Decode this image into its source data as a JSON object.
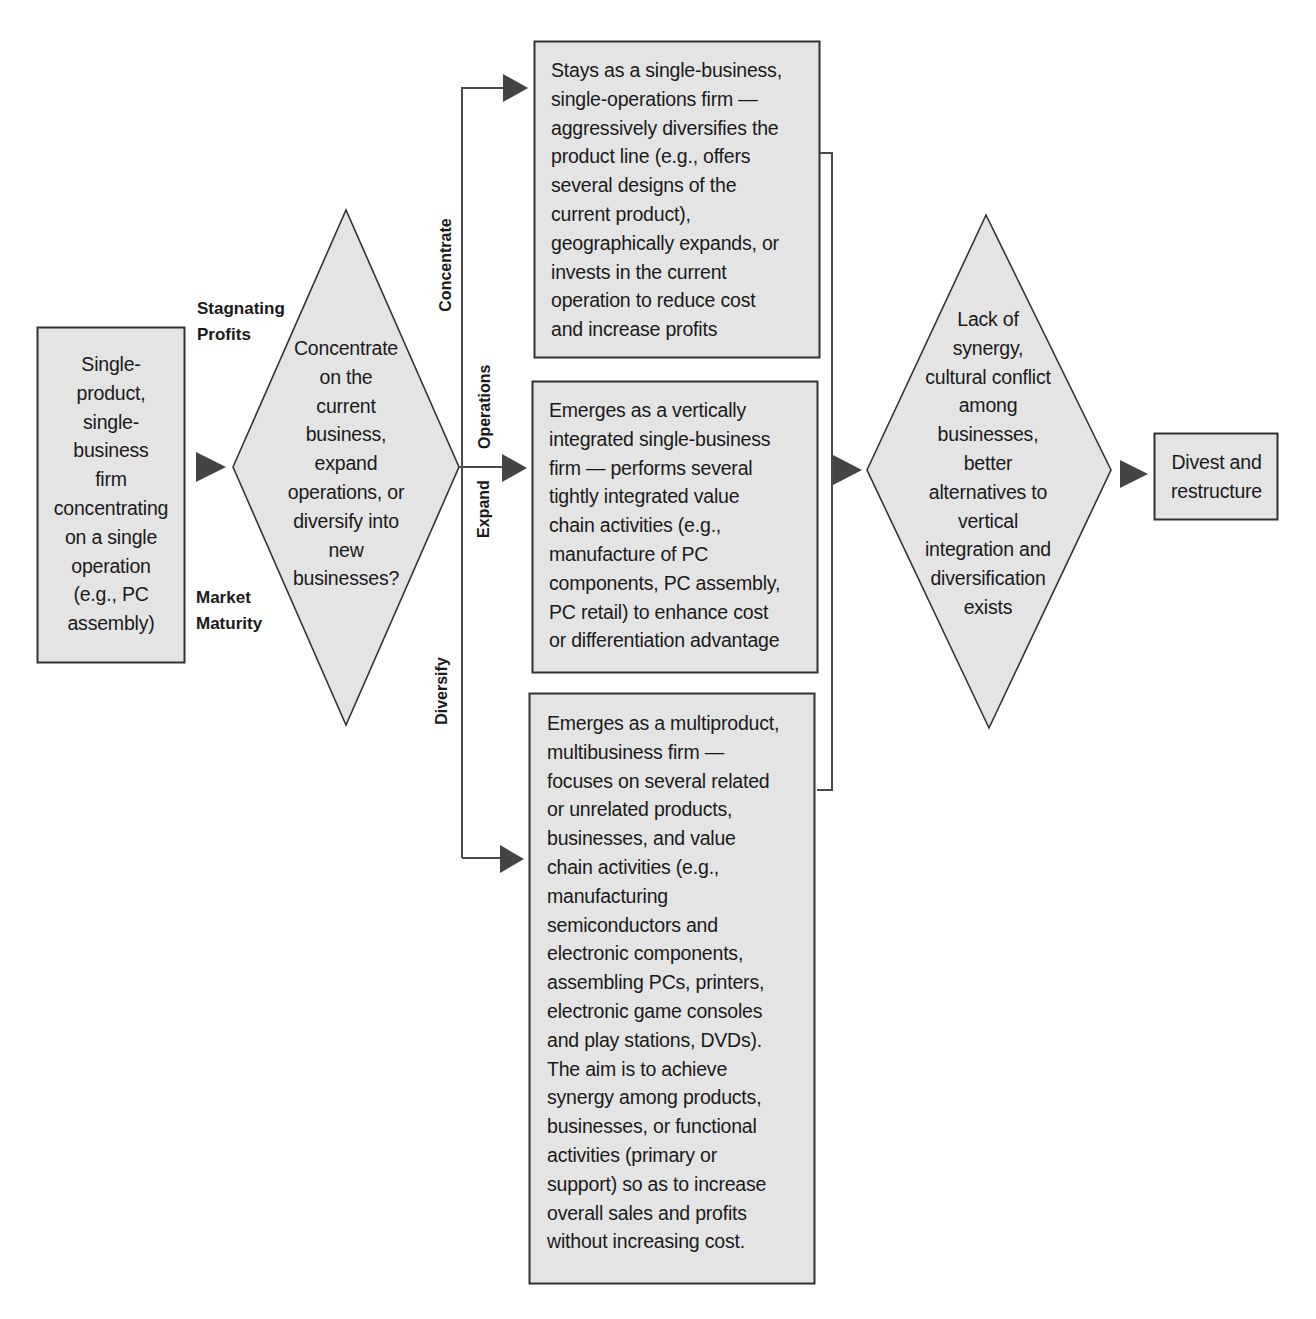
{
  "diagram": {
    "start_box": {
      "text": "Single-product, single-business firm concentrating on a single operation (e.g., PC assembly)",
      "lines": [
        "Single-",
        "product,",
        "single-",
        "business",
        "firm",
        "concentrating",
        "on a single",
        "operation",
        "(e.g., PC",
        "assembly)"
      ]
    },
    "triggers": {
      "top": [
        "Stagnating",
        "Profits"
      ],
      "bottom": [
        "Market",
        "Maturity"
      ]
    },
    "decision_1": {
      "lines": [
        "Concentrate",
        "on the",
        "current",
        "business,",
        "expand",
        "operations, or",
        "diversify into",
        "new",
        "businesses?"
      ]
    },
    "branch_labels": {
      "concentrate": "Concentrate",
      "expand": "Expand",
      "operations": "Operations",
      "diversify": "Diversify"
    },
    "outcomes": [
      {
        "id": "concentrate",
        "lines": [
          "Stays as a single-business,",
          "single-operations firm —",
          "aggressively diversifies the",
          "product line (e.g., offers",
          "several designs of the",
          "current product),",
          "geographically expands, or",
          "invests in the current",
          "operation to reduce cost",
          "and increase profits"
        ]
      },
      {
        "id": "expand",
        "lines": [
          "Emerges as a vertically",
          "integrated single-business",
          "firm — performs several",
          "tightly integrated value",
          "chain activities (e.g.,",
          "manufacture of PC",
          "components, PC assembly,",
          "PC retail) to enhance cost",
          "or differentiation advantage"
        ]
      },
      {
        "id": "diversify",
        "lines": [
          "Emerges as a multiproduct,",
          "multibusiness firm —",
          "focuses on several related",
          "or unrelated products,",
          "businesses, and value",
          "chain activities (e.g.,",
          "manufacturing",
          "semiconductors and",
          "electronic components,",
          "assembling PCs, printers,",
          "electronic game consoles",
          "and play stations, DVDs).",
          "The aim is to achieve",
          "synergy among products,",
          "businesses, or functional",
          "activities (primary or",
          "support) so as to increase",
          "overall sales and profits",
          "without increasing cost."
        ]
      }
    ],
    "decision_2": {
      "lines": [
        "Lack of",
        "synergy,",
        "cultural conflict",
        "among",
        "businesses,",
        "better",
        "alternatives to",
        "vertical",
        "integration and",
        "diversification",
        "exists"
      ]
    },
    "end_box": {
      "lines": [
        "Divest and",
        "restructure"
      ]
    },
    "colors": {
      "shape_fill": "#e4e4e4",
      "shape_stroke": "#333333",
      "arrow_fill": "#444444",
      "connector": "#4a4a4a",
      "text": "#1a1a1a"
    }
  }
}
